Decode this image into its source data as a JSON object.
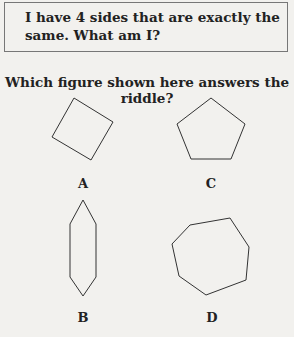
{
  "riddle": {
    "line1": "I have 4 sides that are exactly the",
    "line2": "same. What am I?"
  },
  "question": "Which figure shown here answers the riddle?",
  "figures": [
    {
      "label": "A",
      "shape": "square (rotated)"
    },
    {
      "label": "C",
      "shape": "pentagon"
    },
    {
      "label": "B",
      "shape": "elongated hexagon"
    },
    {
      "label": "D",
      "shape": "heptagon"
    }
  ]
}
